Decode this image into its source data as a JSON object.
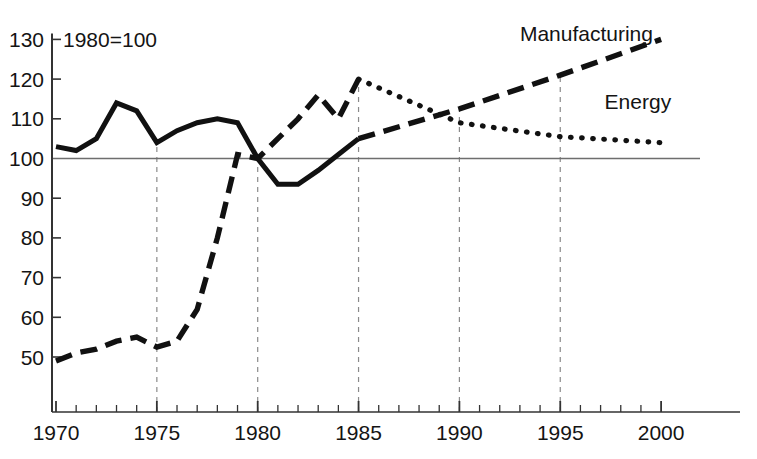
{
  "chart_data": {
    "type": "line",
    "title": "",
    "subtitle": "",
    "note": "1980=100",
    "xlabel": "",
    "ylabel": "",
    "xlim": [
      1970,
      2001.6
    ],
    "ylim": [
      42,
      131
    ],
    "grid": "vertical dashed gridlines at 1975, 1980, 1985, 1990, 1995; horizontal reference line at 100",
    "legend_position": "inline labels at end of each series",
    "reference_line_y": 100,
    "gridline_years": [
      1975,
      1980,
      1985,
      1990,
      1995
    ],
    "x_ticks_major": [
      1970,
      1975,
      1980,
      1985,
      1990,
      1995,
      2000
    ],
    "x_tick_labels": [
      "1970",
      "1975",
      "1980",
      "1985",
      "1990",
      "1995",
      "2000"
    ],
    "x_ticks_minor_step": 1,
    "y_ticks": [
      50,
      60,
      70,
      80,
      90,
      100,
      110,
      120,
      130
    ],
    "y_tick_labels": [
      "50",
      "60",
      "70",
      "80",
      "90",
      "100",
      "110",
      "120",
      "130"
    ],
    "x": [
      1970,
      1971,
      1972,
      1973,
      1974,
      1975,
      1976,
      1977,
      1978,
      1979,
      1980,
      1981,
      1982,
      1983,
      1984,
      1985
    ],
    "projection_x": [
      1985,
      1990,
      1995,
      2000
    ],
    "series": [
      {
        "name": "Manufacturing",
        "label": "Manufacturing",
        "style_history": "dashed",
        "style_projection": "dashed",
        "history_x": [
          1970,
          1971,
          1972,
          1973,
          1974,
          1975,
          1976,
          1977,
          1978,
          1979,
          1980,
          1981,
          1982,
          1983,
          1984,
          1985
        ],
        "history_values": [
          49,
          51,
          52,
          54,
          55,
          52.5,
          54,
          62,
          80,
          101,
          100,
          105,
          110,
          116,
          110,
          120
        ],
        "projection_x": [
          1985,
          1990,
          1995,
          2000
        ],
        "projection_values": [
          105,
          112.5,
          121,
          130
        ],
        "projection_start_value": 105,
        "label_x": 1993.0,
        "label_y": 129.5
      },
      {
        "name": "Energy",
        "label": "Energy",
        "style_history": "solid",
        "style_projection": "dotted",
        "history_x": [
          1970,
          1971,
          1972,
          1973,
          1974,
          1975,
          1976,
          1977,
          1978,
          1979,
          1980,
          1981,
          1982,
          1983,
          1984,
          1985
        ],
        "history_values": [
          103,
          102,
          105,
          114,
          112,
          104,
          107,
          109,
          110,
          109,
          100,
          93.5,
          93.5,
          97,
          101,
          105
        ],
        "projection_x": [
          1985,
          1990,
          1995,
          2000
        ],
        "projection_values": [
          120,
          109,
          105.5,
          104
        ],
        "projection_start_value": 120,
        "label_x": 1997.2,
        "label_y": 112.5
      }
    ],
    "colors": {
      "line": "#111111",
      "axis": "#333333",
      "gridline": "#8a8a8a",
      "reference_line": "#6e6e6e",
      "background": "#ffffff"
    }
  }
}
